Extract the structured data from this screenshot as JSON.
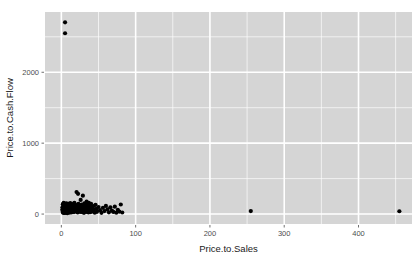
{
  "chart_data": {
    "type": "scatter",
    "title": "",
    "xlabel": "Price.to.Sales",
    "ylabel": "Price.to.Cash.Flow",
    "xlim": [
      -22,
      472
    ],
    "ylim": [
      -140,
      2850
    ],
    "xticks": [
      0,
      100,
      200,
      300,
      400
    ],
    "xtick_labels": [
      "0",
      "100",
      "200",
      "300",
      "400"
    ],
    "yticks": [
      0,
      1000,
      2000
    ],
    "ytick_labels": [
      "0",
      "1000",
      "2000"
    ],
    "xminor": [
      50,
      150,
      250,
      350,
      450
    ],
    "yminor": [
      500,
      1500,
      2500
    ],
    "grid": true,
    "legend": "none",
    "point_color": "#000000",
    "point_size": 2.1,
    "panel_background": "#d5d5d5",
    "grid_color": "#ffffff",
    "points": [
      [
        5,
        2705
      ],
      [
        5,
        2550
      ],
      [
        1.2,
        60
      ],
      [
        1.5,
        95
      ],
      [
        1.8,
        30
      ],
      [
        2.0,
        140
      ],
      [
        2.2,
        75
      ],
      [
        2.5,
        20
      ],
      [
        2.8,
        110
      ],
      [
        3.0,
        55
      ],
      [
        3.2,
        160
      ],
      [
        3.4,
        15
      ],
      [
        3.6,
        90
      ],
      [
        3.8,
        45
      ],
      [
        4.0,
        125
      ],
      [
        4.2,
        70
      ],
      [
        4.4,
        25
      ],
      [
        4.6,
        100
      ],
      [
        4.8,
        50
      ],
      [
        5.0,
        135
      ],
      [
        5.2,
        18
      ],
      [
        5.5,
        80
      ],
      [
        5.8,
        40
      ],
      [
        6.0,
        115
      ],
      [
        6.2,
        65
      ],
      [
        6.5,
        22
      ],
      [
        6.8,
        150
      ],
      [
        7.0,
        95
      ],
      [
        7.2,
        35
      ],
      [
        7.5,
        120
      ],
      [
        7.8,
        58
      ],
      [
        8.0,
        12
      ],
      [
        8.3,
        105
      ],
      [
        8.6,
        72
      ],
      [
        9.0,
        30
      ],
      [
        9.3,
        145
      ],
      [
        9.6,
        85
      ],
      [
        10.0,
        48
      ],
      [
        10.4,
        128
      ],
      [
        10.8,
        62
      ],
      [
        11.2,
        20
      ],
      [
        11.6,
        98
      ],
      [
        12.0,
        155
      ],
      [
        12.4,
        75
      ],
      [
        12.8,
        38
      ],
      [
        13.2,
        112
      ],
      [
        13.6,
        55
      ],
      [
        14.0,
        25
      ],
      [
        14.5,
        140
      ],
      [
        15.0,
        88
      ],
      [
        15.5,
        42
      ],
      [
        16.0,
        118
      ],
      [
        16.5,
        68
      ],
      [
        17.0,
        28
      ],
      [
        17.5,
        160
      ],
      [
        18.0,
        100
      ],
      [
        18.5,
        50
      ],
      [
        19.0,
        130
      ],
      [
        19.5,
        78
      ],
      [
        20.0,
        35
      ],
      [
        20.5,
        310
      ],
      [
        21.0,
        108
      ],
      [
        21.5,
        60
      ],
      [
        22.0,
        22
      ],
      [
        22.5,
        285
      ],
      [
        23.0,
        145
      ],
      [
        23.5,
        85
      ],
      [
        24.0,
        45
      ],
      [
        24.5,
        122
      ],
      [
        25.0,
        66
      ],
      [
        25.5,
        30
      ],
      [
        26.0,
        200
      ],
      [
        26.5,
        95
      ],
      [
        27.0,
        52
      ],
      [
        27.5,
        135
      ],
      [
        28.0,
        72
      ],
      [
        28.5,
        26
      ],
      [
        29.0,
        260
      ],
      [
        29.5,
        110
      ],
      [
        30.0,
        58
      ],
      [
        30.5,
        18
      ],
      [
        31.0,
        150
      ],
      [
        31.5,
        90
      ],
      [
        32.0,
        40
      ],
      [
        32.5,
        125
      ],
      [
        33.0,
        68
      ],
      [
        33.5,
        30
      ],
      [
        34.0,
        175
      ],
      [
        34.5,
        100
      ],
      [
        35.0,
        48
      ],
      [
        35.5,
        132
      ],
      [
        36.0,
        78
      ],
      [
        36.5,
        22
      ],
      [
        37.0,
        158
      ],
      [
        37.5,
        92
      ],
      [
        38.0,
        44
      ],
      [
        38.5,
        118
      ],
      [
        39.0,
        62
      ],
      [
        39.5,
        28
      ],
      [
        40.0,
        145
      ],
      [
        41.0,
        85
      ],
      [
        42.0,
        38
      ],
      [
        43.0,
        112
      ],
      [
        44.0,
        58
      ],
      [
        45.0,
        20
      ],
      [
        46.0,
        130
      ],
      [
        47.0,
        75
      ],
      [
        48.0,
        32
      ],
      [
        50.0,
        100
      ],
      [
        52.0,
        55
      ],
      [
        54.0,
        18
      ],
      [
        56.0,
        88
      ],
      [
        58.0,
        42
      ],
      [
        60.0,
        115
      ],
      [
        62.0,
        65
      ],
      [
        64.0,
        25
      ],
      [
        66.0,
        95
      ],
      [
        68.0,
        50
      ],
      [
        70.0,
        30
      ],
      [
        72.0,
        105
      ],
      [
        74.0,
        20
      ],
      [
        76.0,
        60
      ],
      [
        78.0,
        35
      ],
      [
        80.0,
        135
      ],
      [
        82.0,
        22
      ],
      [
        255,
        42
      ],
      [
        455,
        40
      ]
    ]
  },
  "axis": {
    "x_title": "Price.to.Sales",
    "y_title": "Price.to.Cash.Flow"
  }
}
